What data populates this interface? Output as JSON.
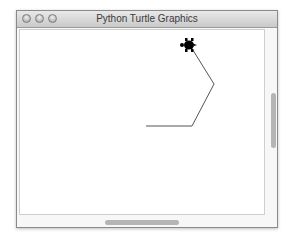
{
  "window": {
    "title": "Python Turtle Graphics",
    "traffic_lights": [
      "close",
      "minimize",
      "zoom"
    ]
  },
  "canvas": {
    "background": "#ffffff",
    "pen_color": "#555555",
    "path_points": [
      [
        145,
        124
      ],
      [
        191,
        124
      ],
      [
        213,
        82
      ],
      [
        190,
        45
      ]
    ],
    "turtle": {
      "x": 188,
      "y": 43,
      "heading": "left",
      "shape": "turtle",
      "color": "#000000"
    }
  },
  "scrollbars": {
    "vertical": {
      "thumb_top": 92,
      "thumb_height": 55
    },
    "horizontal": {
      "thumb_left": 104,
      "thumb_width": 74
    }
  }
}
